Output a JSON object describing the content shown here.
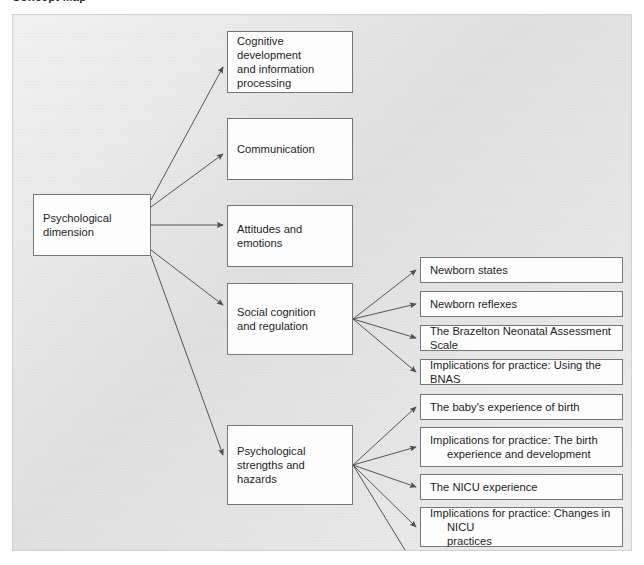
{
  "caption": {
    "text": "Concept Map"
  },
  "diagram": {
    "type": "concept-map",
    "title": "Psychological dimension",
    "colors": {
      "panel_background": "#e3e3e3",
      "node_background": "#fdfdfd",
      "node_border": "#767676",
      "connector": "#555555",
      "text": "#1e1e1e"
    },
    "root": {
      "label": "Psychological\ndimension",
      "x": 20,
      "y": 179,
      "w": 118,
      "h": 62
    },
    "level2": [
      {
        "id": "cognitive-development",
        "label": "Cognitive development\nand information\nprocessing",
        "x": 214,
        "y": 16,
        "w": 126,
        "h": 62,
        "children": []
      },
      {
        "id": "communication",
        "label": "Communication",
        "x": 214,
        "y": 103,
        "w": 126,
        "h": 62,
        "children": []
      },
      {
        "id": "attitudes-and-emotions",
        "label": "Attitudes and emotions",
        "x": 214,
        "y": 190,
        "w": 126,
        "h": 62,
        "children": []
      },
      {
        "id": "social-cognition-and-regulation",
        "label": "Social cognition\nand regulation",
        "x": 214,
        "y": 268,
        "w": 126,
        "h": 72,
        "children": [
          "newborn-states",
          "newborn-reflexes",
          "brazelton-scale",
          "implications-bnas"
        ]
      },
      {
        "id": "psychological-strengths-and-hazards",
        "label": "Psychological\nstrengths and\nhazards",
        "x": 214,
        "y": 410,
        "w": 126,
        "h": 80,
        "children": [
          "baby-experience-of-birth",
          "implications-birth-experience",
          "nicu-experience",
          "implications-nicu-practices",
          "multiple-gestation-births"
        ]
      }
    ],
    "level3": [
      {
        "id": "newborn-states",
        "label": "Newborn states",
        "x": 407,
        "y": 242,
        "w": 203,
        "h": 26,
        "hanging_indent": false
      },
      {
        "id": "newborn-reflexes",
        "label": "Newborn reflexes",
        "x": 407,
        "y": 276,
        "w": 203,
        "h": 26,
        "hanging_indent": false
      },
      {
        "id": "brazelton-scale",
        "label": "The Brazelton Neonatal Assessment Scale",
        "x": 407,
        "y": 310,
        "w": 203,
        "h": 26,
        "hanging_indent": false
      },
      {
        "id": "implications-bnas",
        "label": "Implications for practice: Using the BNAS",
        "x": 407,
        "y": 344,
        "w": 203,
        "h": 26,
        "hanging_indent": false
      },
      {
        "id": "baby-experience-of-birth",
        "label": "The baby's experience of birth",
        "x": 407,
        "y": 379,
        "w": 203,
        "h": 26,
        "hanging_indent": false
      },
      {
        "id": "implications-birth-experience",
        "label": "Implications for practice: The birth\nexperience and development",
        "x": 407,
        "y": 412,
        "w": 203,
        "h": 40,
        "hanging_indent": true
      },
      {
        "id": "nicu-experience",
        "label": "The NICU experience",
        "x": 407,
        "y": 459,
        "w": 203,
        "h": 26,
        "hanging_indent": false
      },
      {
        "id": "implications-nicu-practices",
        "label": "Implications for practice: Changes in NICU\npractices",
        "x": 407,
        "y": 492,
        "w": 203,
        "h": 40,
        "hanging_indent": true
      },
      {
        "id": "multiple-gestation-births",
        "label": "Multiple-gestation births",
        "x": 407,
        "y": 540,
        "w": 203,
        "h": 26,
        "hanging_indent": false
      }
    ],
    "connectors": {
      "from_root": [
        {
          "to": "cognitive-development",
          "x1": 138,
          "y1": 185,
          "x2": 210,
          "y2": 52
        },
        {
          "to": "communication",
          "x1": 138,
          "y1": 192,
          "x2": 210,
          "y2": 139
        },
        {
          "to": "attitudes-and-emotions",
          "x1": 138,
          "y1": 210,
          "x2": 210,
          "y2": 210
        },
        {
          "to": "social-cognition-and-regulation",
          "x1": 138,
          "y1": 235,
          "x2": 210,
          "y2": 290
        },
        {
          "to": "psychological-strengths-and-hazards",
          "x1": 138,
          "y1": 241,
          "x2": 210,
          "y2": 440
        }
      ],
      "from_social": {
        "x1": 340,
        "y1": 304,
        "targets_x": 403
      },
      "from_strengths": {
        "x1": 340,
        "y1": 450,
        "targets_x": 403
      }
    }
  }
}
